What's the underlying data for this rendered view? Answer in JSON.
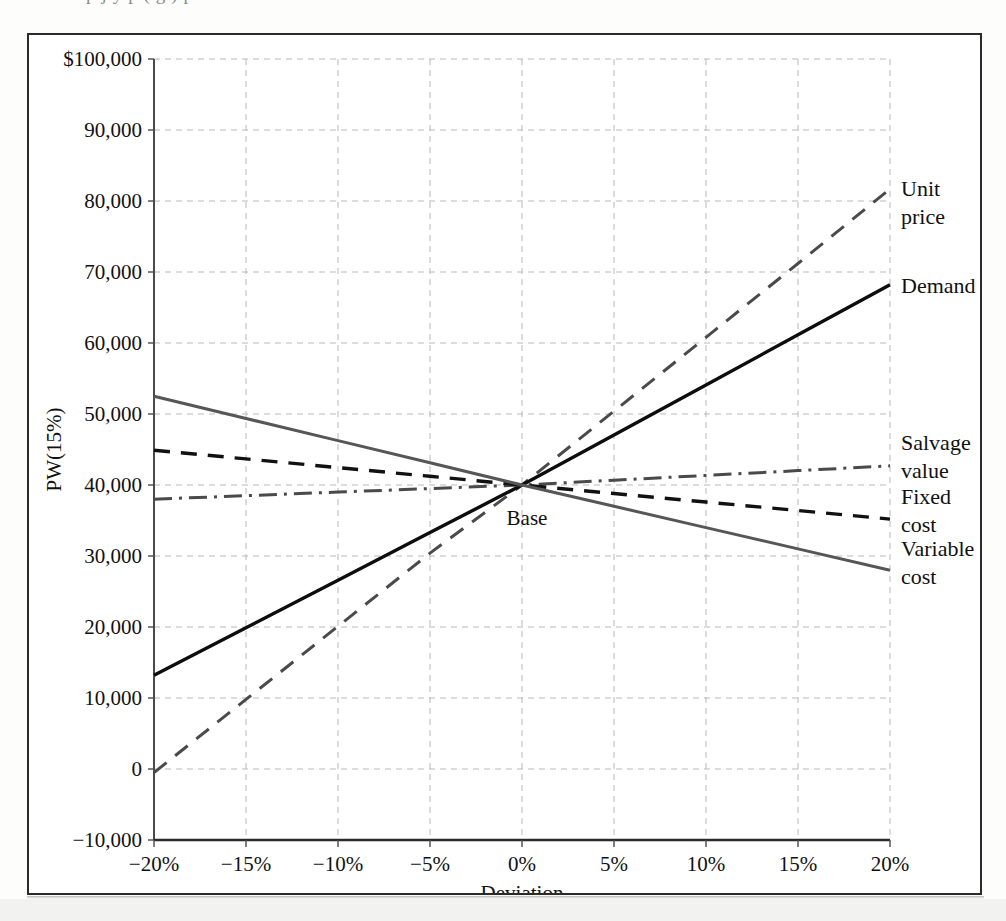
{
  "page": {
    "truncated_top_text": "p j y p ( g ) p"
  },
  "chart_data": {
    "type": "line",
    "title": "",
    "subtitle": "",
    "xlabel": "Deviation",
    "ylabel": "PW(15%)",
    "xlim": [
      -20,
      20
    ],
    "ylim": [
      -10000,
      100000
    ],
    "x": [
      -20,
      -15,
      -10,
      -5,
      0,
      5,
      10,
      15,
      20
    ],
    "x_tick_labels": [
      "−20%",
      "−15%",
      "−10%",
      "−5%",
      "0%",
      "5%",
      "10%",
      "15%",
      "20%"
    ],
    "y_ticks": [
      -10000,
      0,
      10000,
      20000,
      30000,
      40000,
      50000,
      60000,
      70000,
      80000,
      90000,
      100000
    ],
    "y_tick_labels": [
      "−10,000",
      "0",
      "10,000",
      "20,000",
      "30,000",
      "40,000",
      "50,000",
      "60,000",
      "70,000",
      "80,000",
      "90,000",
      "$100,000"
    ],
    "grid": true,
    "grid_style": "dashed",
    "grid_color": "#b9b9b9",
    "legend_position": "right-inline",
    "base_point": {
      "label": "Base",
      "x": 0,
      "y": 40000
    },
    "series": [
      {
        "name": "Unit price",
        "label": "Unit price",
        "style": "dashed",
        "color": "#4a4a4a",
        "width": 3,
        "values": [
          -500,
          9800,
          20100,
          30400,
          40000,
          50400,
          60800,
          71200,
          81700
        ],
        "label_y": 80000
      },
      {
        "name": "Demand",
        "label": "Demand",
        "style": "solid",
        "color": "#0d0d0d",
        "width": 3.4,
        "values": [
          13200,
          19900,
          26600,
          33300,
          40000,
          47050,
          54100,
          61150,
          68200
        ],
        "label_y": 68200
      },
      {
        "name": "Salvage value",
        "label": "Salvage value",
        "style": "dashdot",
        "color": "#4a4a4a",
        "width": 3,
        "values": [
          38000,
          38500,
          39000,
          39500,
          40000,
          40675,
          41350,
          42025,
          42700
        ],
        "label_y": 44200
      },
      {
        "name": "Fixed cost",
        "label": "Fixed cost",
        "style": "dashed",
        "color": "#111111",
        "width": 3.4,
        "values": [
          44900,
          43675,
          42450,
          41225,
          40000,
          38800,
          37600,
          36400,
          35200
        ],
        "label_y": 36600
      },
      {
        "name": "Variable cost",
        "label": "Variable cost",
        "style": "solid",
        "color": "#565656",
        "width": 3,
        "values": [
          52500,
          49375,
          46250,
          43125,
          40000,
          37000,
          34000,
          31000,
          28000
        ],
        "label_y": 29300
      }
    ]
  }
}
